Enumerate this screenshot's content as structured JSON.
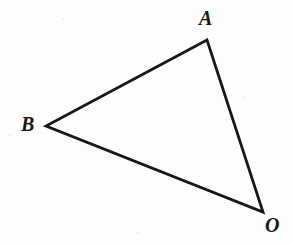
{
  "figure": {
    "type": "geometry-diagram",
    "background_color": "#fdfdfd",
    "stroke_color": "#17171a",
    "stroke_width": 2.8,
    "width": 293,
    "height": 245,
    "vertices": [
      {
        "id": "A",
        "label": "A",
        "x": 207,
        "y": 40
      },
      {
        "id": "B",
        "label": "B",
        "x": 46,
        "y": 126
      },
      {
        "id": "O",
        "label": "O",
        "x": 263,
        "y": 212
      }
    ],
    "edges": [
      {
        "id": "BA",
        "from": "B",
        "to": "A"
      },
      {
        "id": "AO",
        "from": "A",
        "to": "O"
      },
      {
        "id": "OB",
        "from": "O",
        "to": "B"
      }
    ],
    "labels": {
      "A": "A",
      "B": "B",
      "O": "O"
    },
    "path": "M 46 126 L 207 40 L 263 212 Z"
  }
}
